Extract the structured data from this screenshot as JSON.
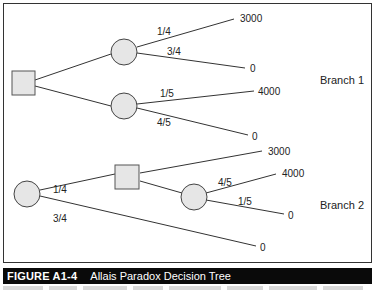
{
  "figure": {
    "number": "FIGURE A1-4",
    "title": "Allais Paradox Decision Tree"
  },
  "tree": {
    "branch1": {
      "label": "Branch 1",
      "decision_node": "square",
      "chance_nodes": [
        {
          "outcomes": [
            {
              "prob": "1/4",
              "payoff": "3000"
            },
            {
              "prob": "3/4",
              "payoff": "0"
            }
          ]
        },
        {
          "outcomes": [
            {
              "prob": "1/5",
              "payoff": "4000"
            },
            {
              "prob": "4/5",
              "payoff": "0"
            }
          ]
        }
      ]
    },
    "branch2": {
      "label": "Branch 2",
      "root_chance": {
        "outcomes": [
          {
            "prob": "1/4",
            "leads_to": "decision_node"
          },
          {
            "prob": "3/4",
            "payoff": "0"
          }
        ]
      },
      "decision_node": {
        "options": [
          {
            "payoff": "3000"
          },
          {
            "chance": {
              "outcomes": [
                {
                  "prob": "4/5",
                  "payoff": "4000"
                },
                {
                  "prob": "1/5",
                  "payoff": "0"
                }
              ]
            }
          }
        ]
      }
    }
  },
  "colors": {
    "node_fill": "#e6e6e6",
    "stroke": "#333333",
    "caption_bg": "#0a0a0a",
    "caption_text": "#ffffff"
  }
}
